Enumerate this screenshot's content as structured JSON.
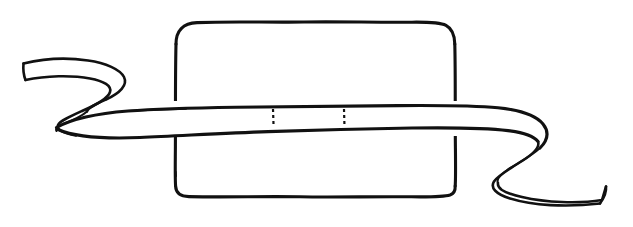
{
  "image": {
    "title": "Hand-drawn box tied with a ribbon",
    "subject": "gift-box-with-ribbon",
    "style": "black ink line drawing on white",
    "width": 633,
    "height": 227,
    "background_color": "#ffffff",
    "ink_color": "#111111"
  },
  "elements": {
    "box": {
      "name": "rounded rectangular box",
      "label": "",
      "corner_style": "rounded",
      "left": 175,
      "top": 22,
      "right": 455,
      "bottom": 196,
      "corner_radius": 22
    },
    "ribbon": {
      "name": "ribbon band wrapped horizontally around box",
      "label": "",
      "band_top_y": 105,
      "band_bottom_y": 130,
      "left_end": "curled twist with flat cut tip",
      "right_end": "curled twist with flat cut tip",
      "left_tip_x": 22,
      "right_tip_x": 607
    },
    "tick_marks": {
      "name": "short dashed vertical marks on ribbon",
      "label": "",
      "count": 2,
      "positions_x": [
        273,
        344
      ],
      "top_y": 109,
      "bottom_y": 126
    }
  },
  "annotations": {
    "caption": "",
    "notes": ""
  }
}
